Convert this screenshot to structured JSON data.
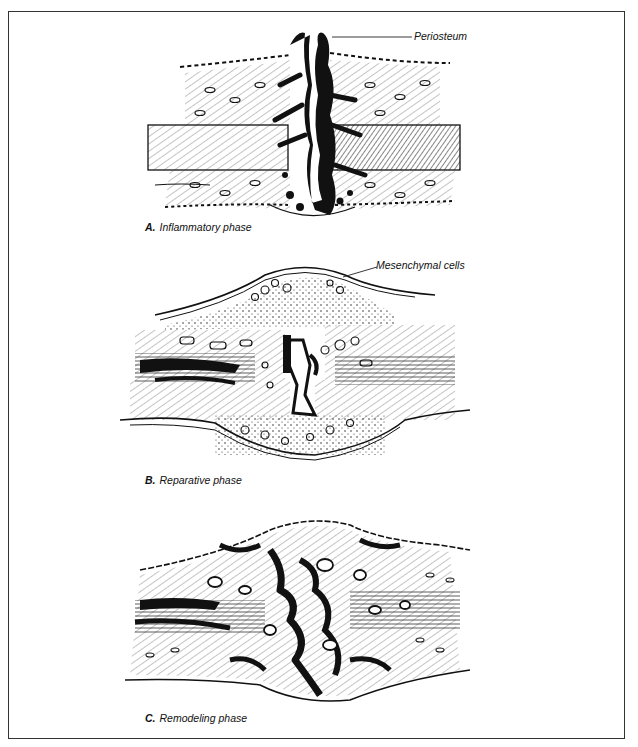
{
  "figure": {
    "panels": [
      {
        "letter": "A.",
        "caption": "Inflammatory phase",
        "callouts": [
          {
            "label": "Periosteum"
          }
        ]
      },
      {
        "letter": "B.",
        "caption": "Reparative phase",
        "callouts": [
          {
            "label": "Mesenchymal cells"
          }
        ]
      },
      {
        "letter": "C.",
        "caption": "Remodeling phase",
        "callouts": []
      }
    ],
    "colors": {
      "ink": "#111111",
      "background": "#ffffff",
      "frame": "#333333"
    }
  }
}
